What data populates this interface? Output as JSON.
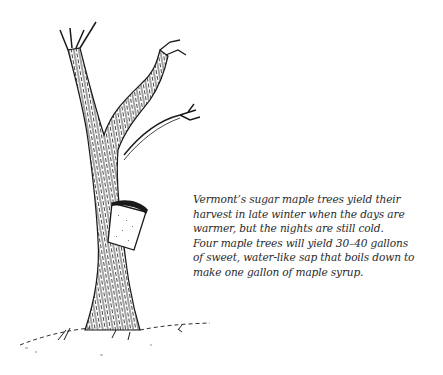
{
  "illustration": {
    "subject": "sugar maple tree with sap bucket",
    "ink_color": "#1a1a1a",
    "bucket_color": "#ffffff"
  },
  "caption": {
    "lines": [
      "Vermont’s sugar maple trees yield their",
      "harvest in late winter when the days are",
      "warmer, but the nights are still cold.",
      "Four maple trees will yield 30–40 gallons",
      "of sweet, water-like sap that boils down to",
      "make one gallon of maple syrup."
    ]
  }
}
